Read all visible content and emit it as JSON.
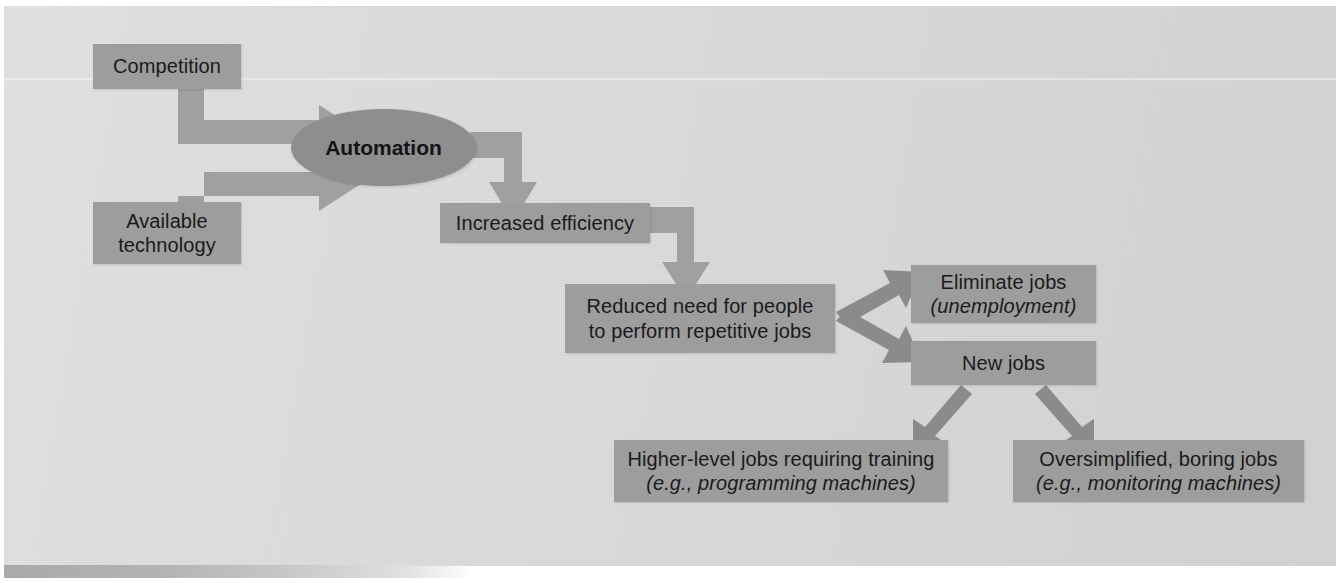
{
  "diagram": {
    "colors": {
      "page_background": "#dcdcdc",
      "node_fill": "#9d9d9d",
      "ellipse_fill": "#8e8e8e",
      "arrow_fill": "#a0a0a0",
      "arrow_fill_dark": "#8b8b8b",
      "text": "#1a1a1a"
    },
    "nodes": [
      {
        "id": "competition",
        "label": "Competition",
        "shape": "rect"
      },
      {
        "id": "available_technology",
        "line1": "Available",
        "line2": "technology",
        "shape": "rect"
      },
      {
        "id": "automation",
        "label": "Automation",
        "shape": "ellipse",
        "bold": true
      },
      {
        "id": "increased_efficiency",
        "label": "Increased efficiency",
        "shape": "rect"
      },
      {
        "id": "reduced_need",
        "line1": "Reduced need for people",
        "line2": "to perform repetitive jobs",
        "shape": "rect"
      },
      {
        "id": "eliminate_jobs",
        "line1": "Eliminate jobs",
        "line2": "(unemployment)",
        "line2_italic": true,
        "shape": "rect"
      },
      {
        "id": "new_jobs",
        "label": "New jobs",
        "shape": "rect"
      },
      {
        "id": "higher_level_jobs",
        "line1": "Higher-level jobs requiring training",
        "line2": "(e.g., programming machines)",
        "line2_italic": true,
        "shape": "rect"
      },
      {
        "id": "oversimplified_jobs",
        "line1": "Oversimplified, boring jobs",
        "line2": "(e.g., monitoring machines)",
        "line2_italic": true,
        "shape": "rect"
      }
    ],
    "edges": [
      {
        "id": "competition-to-automation",
        "from": "competition",
        "to": "automation",
        "style": "elbow-right"
      },
      {
        "id": "technology-to-automation",
        "from": "available_technology",
        "to": "automation",
        "style": "elbow-right"
      },
      {
        "id": "automation-to-efficiency",
        "from": "automation",
        "to": "increased_efficiency",
        "style": "elbow-down"
      },
      {
        "id": "efficiency-to-reduced",
        "from": "increased_efficiency",
        "to": "reduced_need",
        "style": "elbow-down"
      },
      {
        "id": "reduced-to-eliminate",
        "from": "reduced_need",
        "to": "eliminate_jobs",
        "style": "diagonal-up-right"
      },
      {
        "id": "reduced-to-newjobs",
        "from": "reduced_need",
        "to": "new_jobs",
        "style": "diagonal-down-right"
      },
      {
        "id": "newjobs-to-higher",
        "from": "new_jobs",
        "to": "higher_level_jobs",
        "style": "diagonal-down-left"
      },
      {
        "id": "newjobs-to-oversimplified",
        "from": "new_jobs",
        "to": "oversimplified_jobs",
        "style": "diagonal-down-right"
      }
    ]
  }
}
